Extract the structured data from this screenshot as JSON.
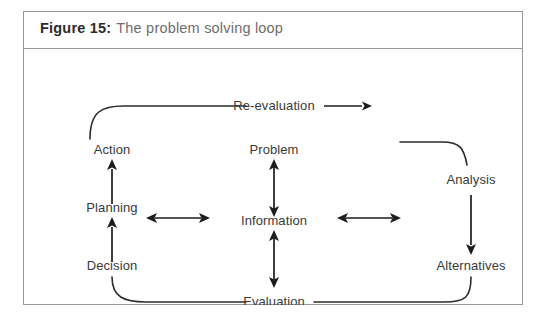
{
  "figure": {
    "caption_label": "Figure 15:",
    "caption_title": "The problem solving loop",
    "border_color": "#9a9a9a",
    "ink_color": "#2b2b2b",
    "label_color": "#3a3a3a",
    "caption_title_color": "#6e6e6e",
    "background": "#ffffff"
  },
  "diagram": {
    "type": "cycle-flow",
    "nodes": [
      {
        "id": "action",
        "label": "Action",
        "column": "left",
        "x": 88,
        "y": 60
      },
      {
        "id": "planning",
        "label": "Planning",
        "column": "left",
        "x": 88,
        "y": 118
      },
      {
        "id": "decision",
        "label": "Decision",
        "column": "left",
        "x": 88,
        "y": 176
      },
      {
        "id": "problem",
        "label": "Problem",
        "column": "center",
        "x": 250,
        "y": 60
      },
      {
        "id": "information",
        "label": "Information",
        "column": "center",
        "x": 250,
        "y": 118
      },
      {
        "id": "evaluation",
        "label": "Evaluation",
        "column": "center",
        "x": 250,
        "y": 176
      },
      {
        "id": "analysis",
        "label": "Analysis",
        "column": "right",
        "x": 428,
        "y": 100
      },
      {
        "id": "alternatives",
        "label": "Alternatives",
        "column": "right",
        "x": 428,
        "y": 176
      },
      {
        "id": "reevaluation",
        "label": "Re-evaluation",
        "column": "top",
        "x": 250,
        "y": 20
      }
    ],
    "connectors": [
      {
        "id": "decision-to-planning",
        "from": "decision",
        "to": "planning",
        "style": "arrow-single-up"
      },
      {
        "id": "planning-to-action",
        "from": "planning",
        "to": "action",
        "style": "arrow-single-up"
      },
      {
        "id": "action-to-reevaluation",
        "from": "action",
        "to": "reevaluation",
        "style": "curve-plain"
      },
      {
        "id": "reevaluation-to-analysis",
        "from": "reevaluation",
        "to": "analysis",
        "style": "arrow-single-right"
      },
      {
        "id": "top-right-curve",
        "from": "reevaluation",
        "to": "analysis",
        "style": "curve-plain"
      },
      {
        "id": "analysis-to-alternatives",
        "from": "analysis",
        "to": "alternatives",
        "style": "arrow-single-down"
      },
      {
        "id": "alternatives-to-evaluation",
        "from": "alternatives",
        "to": "evaluation",
        "style": "curve-plain"
      },
      {
        "id": "evaluation-to-decision",
        "from": "evaluation",
        "to": "decision",
        "style": "curve-plain"
      },
      {
        "id": "problem-information",
        "from": "problem",
        "to": "information",
        "style": "arrow-double-vertical"
      },
      {
        "id": "information-evaluation",
        "from": "information",
        "to": "evaluation",
        "style": "arrow-double-vertical"
      },
      {
        "id": "left-information",
        "from": "left-column",
        "to": "information",
        "style": "arrow-double-horizontal"
      },
      {
        "id": "right-information",
        "from": "information",
        "to": "right-column",
        "style": "arrow-double-horizontal"
      }
    ]
  }
}
